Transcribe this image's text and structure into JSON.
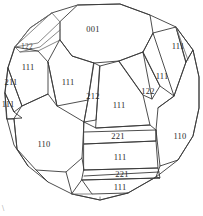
{
  "figure": {
    "kind": "crystal-habit-line-drawing",
    "background_color": "#ffffff",
    "line_color": "#3a3a3a",
    "text_color": "#2b2b2b",
    "width": 203,
    "height": 216,
    "corner_mark": "\\"
  },
  "labels": [
    {
      "id": "face-001-top",
      "text": "001",
      "x": 93,
      "y": 29,
      "size": "normal"
    },
    {
      "id": "face-122-upper-left",
      "text": "122",
      "x": 27,
      "y": 47,
      "size": "tiny"
    },
    {
      "id": "face-111-left-upper",
      "text": "111",
      "x": 28,
      "y": 67,
      "size": "normal"
    },
    {
      "id": "face-211-left",
      "text": "211",
      "x": 11,
      "y": 82,
      "size": "normal"
    },
    {
      "id": "face-111-left-lower",
      "text": "111",
      "x": 8,
      "y": 104,
      "size": "normal"
    },
    {
      "id": "face-111-upper-mid",
      "text": "111",
      "x": 68,
      "y": 82,
      "size": "normal"
    },
    {
      "id": "face-212-center",
      "text": "212",
      "x": 93,
      "y": 96,
      "size": "normal"
    },
    {
      "id": "face-111-center",
      "text": "111",
      "x": 119,
      "y": 105,
      "size": "normal"
    },
    {
      "id": "face-122-right",
      "text": "122",
      "x": 148,
      "y": 91,
      "size": "normal"
    },
    {
      "id": "face-111-right-mid",
      "text": "111",
      "x": 162,
      "y": 76,
      "size": "normal"
    },
    {
      "id": "face-111-right-top",
      "text": "111",
      "x": 178,
      "y": 46,
      "size": "normal"
    },
    {
      "id": "face-110-left",
      "text": "110",
      "x": 44,
      "y": 144,
      "size": "normal"
    },
    {
      "id": "face-110-right",
      "text": "110",
      "x": 180,
      "y": 136,
      "size": "normal"
    },
    {
      "id": "face-221-upper",
      "text": "221",
      "x": 118,
      "y": 136,
      "size": "normal"
    },
    {
      "id": "face-111-lower-mid",
      "text": "111",
      "x": 120,
      "y": 157,
      "size": "normal"
    },
    {
      "id": "face-221-lower",
      "text": "221",
      "x": 122,
      "y": 174,
      "size": "normal"
    },
    {
      "id": "face-111-bottom",
      "text": "111",
      "x": 120,
      "y": 187,
      "size": "normal"
    }
  ]
}
